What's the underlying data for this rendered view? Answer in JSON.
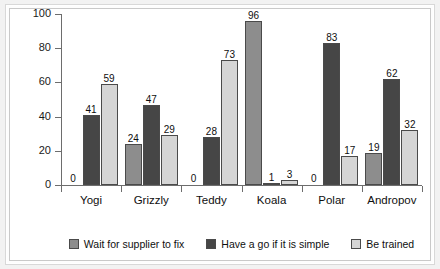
{
  "chart_data": {
    "type": "bar",
    "title": "",
    "subtitle": "",
    "xlabel": "",
    "ylabel": "",
    "ylim": [
      0,
      100
    ],
    "yticks": [
      0,
      20,
      40,
      60,
      80,
      100
    ],
    "grid": false,
    "legend_position": "bottom",
    "categories": [
      "Yogi",
      "Grizzly",
      "Teddy",
      "Koala",
      "Polar",
      "Andropov"
    ],
    "series": [
      {
        "name": "Wait for supplier to fix",
        "color": "#8d8d8d",
        "values": [
          0,
          24,
          0,
          96,
          0,
          19
        ]
      },
      {
        "name": "Have a go if it is simple",
        "color": "#464646",
        "values": [
          41,
          47,
          28,
          1,
          83,
          62
        ]
      },
      {
        "name": "Be trained",
        "color": "#d5d5d5",
        "values": [
          59,
          29,
          73,
          3,
          17,
          32
        ]
      }
    ]
  }
}
